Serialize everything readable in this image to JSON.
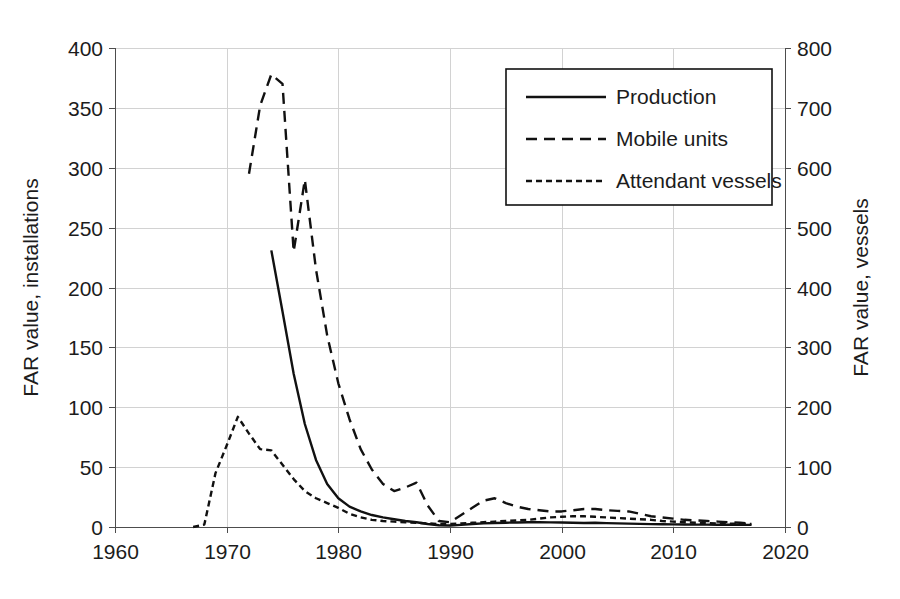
{
  "chart_data": {
    "type": "line",
    "title": "",
    "subtitle": "",
    "xlabel": "",
    "ylabel": "FAR value, installations",
    "y2label": "FAR value, vessels",
    "xlim": [
      1960,
      2020
    ],
    "ylim": [
      0,
      400
    ],
    "y2lim": [
      0,
      800
    ],
    "xticks": [
      1960,
      1970,
      1980,
      1990,
      2000,
      2010,
      2020
    ],
    "yticks": [
      0,
      50,
      100,
      150,
      200,
      250,
      300,
      350,
      400
    ],
    "y2ticks": [
      0,
      100,
      200,
      300,
      400,
      500,
      600,
      700,
      800
    ],
    "grid": true,
    "legend_position": "upper right",
    "legend_entries": [
      "Production",
      "Mobile units",
      "Attendant vessels"
    ],
    "series": [
      {
        "name": "Production",
        "axis": "left",
        "style": "solid",
        "x": [
          1974,
          1975,
          1976,
          1977,
          1978,
          1979,
          1980,
          1981,
          1982,
          1983,
          1984,
          1985,
          1986,
          1987,
          1988,
          1989,
          1990,
          1991,
          1992,
          1993,
          1994,
          1995,
          1996,
          1997,
          1998,
          1999,
          2000,
          2001,
          2002,
          2003,
          2004,
          2005,
          2006,
          2007,
          2008,
          2009,
          2010,
          2011,
          2012,
          2013,
          2014,
          2015,
          2016,
          2017
        ],
        "values": [
          231,
          180,
          128,
          86,
          56,
          36,
          24,
          17,
          13,
          10,
          8,
          6.5,
          5,
          4,
          2.5,
          1.5,
          1.2,
          1.8,
          2.5,
          3,
          3.4,
          3.6,
          3.8,
          4,
          4,
          3.9,
          3.8,
          3.6,
          3.4,
          3.6,
          3.2,
          3,
          2.8,
          2.6,
          2.4,
          2.3,
          2.2,
          2.1,
          2.0,
          2.0,
          1.9,
          1.9,
          1.8,
          1.8
        ]
      },
      {
        "name": "Mobile units",
        "axis": "left",
        "style": "dashed",
        "x": [
          1972,
          1973,
          1974,
          1975,
          1976,
          1977,
          1978,
          1979,
          1980,
          1981,
          1982,
          1983,
          1984,
          1985,
          1986,
          1987,
          1988,
          1989,
          1990,
          1991,
          1992,
          1993,
          1994,
          1995,
          1996,
          1997,
          1998,
          1999,
          2000,
          2001,
          2002,
          2003,
          2004,
          2005,
          2006,
          2007,
          2008,
          2009,
          2010,
          2011,
          2012,
          2013,
          2014,
          2015,
          2016,
          2017
        ],
        "values": [
          295,
          352,
          378,
          370,
          230,
          290,
          215,
          160,
          120,
          90,
          65,
          48,
          36,
          30,
          33,
          37,
          18,
          5,
          4,
          10,
          16,
          22,
          24,
          20,
          17,
          15,
          14,
          13,
          13,
          14,
          15,
          15,
          14,
          13.5,
          13,
          11,
          9,
          8,
          7,
          6,
          5.5,
          5,
          4.5,
          4,
          3.5,
          3
        ]
      },
      {
        "name": "Attendant vessels",
        "axis": "left",
        "style": "dotted",
        "x": [
          1967,
          1968,
          1969,
          1970,
          1971,
          1972,
          1973,
          1974,
          1975,
          1976,
          1977,
          1978,
          1979,
          1980,
          1981,
          1982,
          1983,
          1984,
          1985,
          1986,
          1987,
          1988,
          1989,
          1990,
          1991,
          1992,
          1993,
          1994,
          1995,
          1996,
          1997,
          1998,
          1999,
          2000,
          2001,
          2002,
          2003,
          2004,
          2005,
          2006,
          2007,
          2008,
          2009,
          2010,
          2011,
          2012,
          2013,
          2014,
          2015,
          2016,
          2017
        ],
        "values": [
          0,
          2,
          45,
          68,
          92,
          78,
          65,
          64,
          52,
          40,
          30,
          24,
          20,
          16,
          11,
          8,
          6,
          5,
          4.5,
          4,
          3.5,
          3,
          2.5,
          2.5,
          3,
          3.5,
          4,
          4.5,
          5,
          5.5,
          6,
          7,
          8,
          8.5,
          9,
          9,
          8.5,
          8,
          7.5,
          7,
          6.5,
          6,
          5,
          4.5,
          4,
          3.5,
          3.2,
          3,
          2.8,
          2.6,
          2.5
        ]
      }
    ]
  },
  "axes": {
    "left": {
      "title": "FAR value, installations",
      "ticks": [
        "400",
        "350",
        "300",
        "250",
        "200",
        "150",
        "100",
        "50",
        "0"
      ]
    },
    "right": {
      "title": "FAR value, vessels",
      "ticks": [
        "800",
        "700",
        "600",
        "500",
        "400",
        "300",
        "200",
        "100",
        "0"
      ]
    },
    "bottom": {
      "title": "",
      "ticks": [
        "1960",
        "1970",
        "1980",
        "1990",
        "2000",
        "2010",
        "2020"
      ]
    }
  },
  "legend": {
    "items": [
      {
        "label": "Production",
        "style": "solid"
      },
      {
        "label": "Mobile units",
        "style": "dashed"
      },
      {
        "label": "Attendant vessels",
        "style": "dotted"
      }
    ]
  },
  "colors": {
    "line": "#111111",
    "grid": "#d2d2d2",
    "axis": "#4d4d4d",
    "background": "#ffffff",
    "text": "#1c1c1c"
  }
}
